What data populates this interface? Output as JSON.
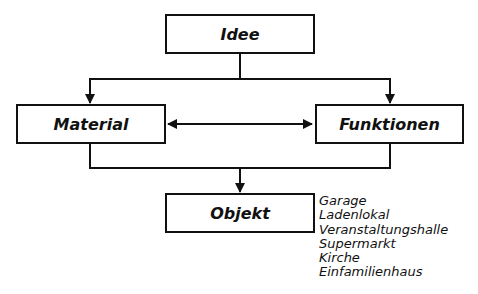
{
  "diagram": {
    "nodes": {
      "idee": "Idee",
      "material": "Material",
      "funktionen": "Funktionen",
      "objekt": "Objekt"
    },
    "objekt_examples": [
      "Garage",
      "Ladenlokal",
      "Veranstaltungshalle",
      "Supermarkt",
      "Kirche",
      "Einfamilienhaus"
    ],
    "edges": [
      {
        "from": "Idee",
        "to": "Material"
      },
      {
        "from": "Idee",
        "to": "Funktionen"
      },
      {
        "from": "Material",
        "to": "Funktionen",
        "bidirectional": true
      },
      {
        "from": "Material",
        "to": "Objekt"
      },
      {
        "from": "Funktionen",
        "to": "Objekt"
      }
    ]
  }
}
